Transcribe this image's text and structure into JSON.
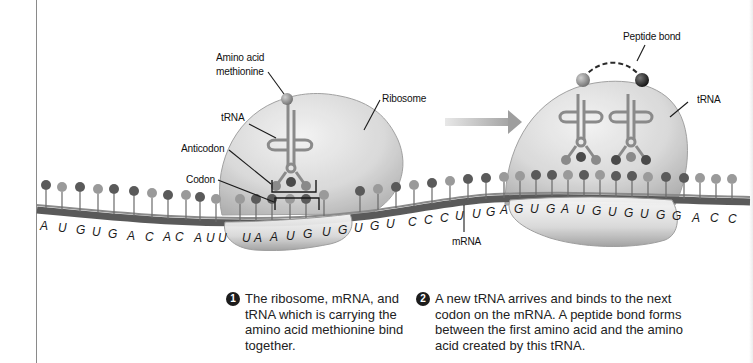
{
  "diagram": {
    "labels": {
      "amino_acid_line1": "Amino acid",
      "amino_acid_line2": "methionine",
      "trna_left": "tRNA",
      "anticodon": "Anticodon",
      "codon": "Codon",
      "ribosome": "Ribosome",
      "peptide_bond": "Peptide bond",
      "trna_right": "tRNA",
      "mrna": "mRNA"
    },
    "mrna_sequence": [
      "A",
      "U",
      "G",
      "U",
      "G",
      "A",
      "C",
      "A",
      "C",
      "A",
      "U",
      "U",
      "U",
      "A",
      "A",
      "U",
      "G",
      "U",
      "G",
      "U",
      "G",
      "U",
      "C",
      "C",
      "C",
      "U",
      "U",
      "G",
      "A",
      "G",
      "U",
      "G",
      "A",
      "U",
      "G",
      "U",
      "G",
      "U",
      "G",
      "G",
      "A",
      "C",
      "C"
    ],
    "colors": {
      "ribosome": "#c9c9c9",
      "mrna_strand": "#5a5a5a",
      "base_dark": "#555555",
      "base_light": "#9a9a9a",
      "amino_acid_1": "#8f8f8f",
      "amino_acid_2": "#2a2a2a",
      "arrow": "#a8a8a8",
      "step_badge": "#1c1c1c"
    },
    "steps": [
      {
        "number": "1",
        "text": "The ribosome, mRNA, and tRNA which is carrying the amino acid methionine bind together."
      },
      {
        "number": "2",
        "text": "A new tRNA arrives and binds to the next codon on the mRNA. A peptide bond forms between the first amino acid and the amino acid created by this tRNA."
      }
    ]
  }
}
